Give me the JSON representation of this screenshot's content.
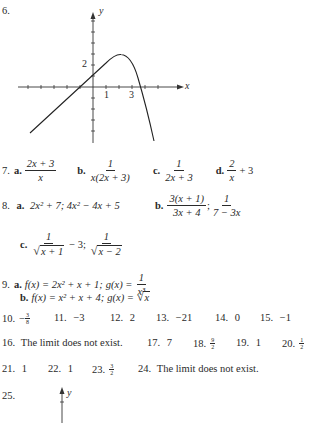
{
  "problem_6": {
    "number": "6.",
    "graph": {
      "x_axis_label": "x",
      "y_axis_label": "y",
      "x_tick_labels": [
        "1",
        "3"
      ],
      "y_tick_labels": [
        "2"
      ],
      "description": "Line rising from lower-left through x-intercept near -0.5, y-intercept near 1, peaking near (2.3, 3), then falling steeply through x-intercept near 3.6"
    }
  },
  "problem_7": {
    "number": "7.",
    "parts": [
      {
        "label": "a.",
        "num": "2x + 3",
        "den": "x"
      },
      {
        "label": "b.",
        "num": "1",
        "den": "x(2x + 3)"
      },
      {
        "label": "c.",
        "num": "1",
        "den": "2x + 3"
      },
      {
        "label": "d.",
        "num": "2",
        "den": "x",
        "suffix": "+ 3"
      }
    ]
  },
  "problem_8": {
    "number": "8.",
    "a": {
      "label": "a.",
      "text": "2x² + 7; 4x² − 4x + 5"
    },
    "b": {
      "label": "b.",
      "first_num": "3(x + 1)",
      "first_den": "3x + 4",
      "sep": ";",
      "second_num": "1",
      "second_den": "7 − 3x"
    },
    "c": {
      "label": "c.",
      "first_num": "1",
      "first_den_rad": "x + 1",
      "middle": "− 3;",
      "second_num": "1",
      "second_den_rad": "x − 2"
    }
  },
  "problem_9": {
    "number": "9.",
    "a": {
      "label": "a.",
      "f": "f(x) = 2x² + x + 1;",
      "g_prefix": "g(x) =",
      "g_num": "1",
      "g_den": "x³"
    },
    "b": {
      "label": "b.",
      "f": "f(x) = x² + x + 4;",
      "g_prefix": "g(x) =",
      "g_rad": "x"
    }
  },
  "answers_row_1": [
    {
      "number": "10.",
      "sign": "−",
      "num": "3",
      "den": "8"
    },
    {
      "number": "11.",
      "value": "−3"
    },
    {
      "number": "12.",
      "value": "2"
    },
    {
      "number": "13.",
      "value": "−21"
    },
    {
      "number": "14.",
      "value": "0"
    },
    {
      "number": "15.",
      "value": "−1"
    }
  ],
  "answers_row_2": [
    {
      "number": "16.",
      "value": "The limit does not exist."
    },
    {
      "number": "17.",
      "value": "7"
    },
    {
      "number": "18.",
      "num": "9",
      "den": "2"
    },
    {
      "number": "19.",
      "value": "1"
    },
    {
      "number": "20.",
      "num": "1",
      "den": "2"
    }
  ],
  "answers_row_3": [
    {
      "number": "21.",
      "value": "1"
    },
    {
      "number": "22.",
      "value": "1"
    },
    {
      "number": "23.",
      "num": "3",
      "den": "2"
    },
    {
      "number": "24.",
      "value": "The limit does not exist."
    }
  ],
  "problem_25": {
    "number": "25.",
    "graph": {
      "y_axis_label": "y"
    }
  }
}
